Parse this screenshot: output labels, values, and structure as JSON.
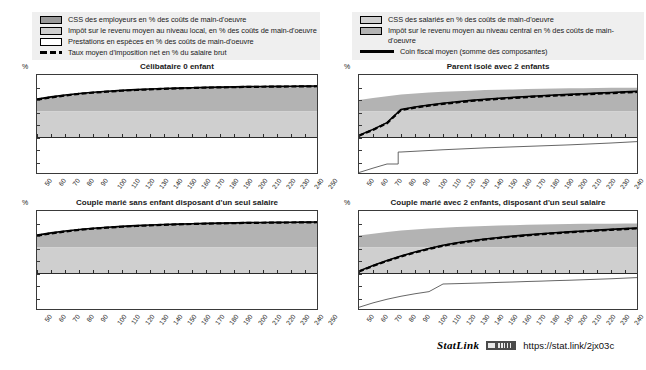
{
  "legend": {
    "left": [
      {
        "swatch": "dark",
        "label": "CSS des employeurs en % des coûts de main-d'oeuvre",
        "icon": "legend-swatch-dark-gray"
      },
      {
        "swatch": "light",
        "label": "Impôt sur le revenu moyen au niveau local, en % des coûts de main-d'oeuvre",
        "icon": "legend-swatch-light-gray"
      },
      {
        "swatch": "white",
        "label": "Prestations en espèces en % des coûts de main-d'oeuvre",
        "icon": "legend-swatch-white"
      },
      {
        "swatch": "dashed",
        "label": "Taux moyen d'imposition net en % du salaire brut",
        "icon": "legend-line-dashed"
      }
    ],
    "right": [
      {
        "swatch": "light",
        "label": "CSS des salariés en % des coûts de main-d'oeuvre",
        "icon": "legend-swatch-light-gray"
      },
      {
        "swatch": "mid",
        "label": "Impôt sur le revenu moyen au niveau central en %  des coûts de main-d'oeuvre",
        "icon": "legend-swatch-mid-gray"
      },
      {
        "swatch": "solid",
        "label": "Coin fiscal moyen (somme des composantes)",
        "icon": "legend-line-solid"
      }
    ]
  },
  "statlink": {
    "word": "StatLink",
    "badge": "statlink-barcode-icon",
    "url": "https://stat.link/2jx03c"
  },
  "axis": {
    "y_unit": "%",
    "yticks": [
      50,
      40,
      30,
      20,
      10,
      0,
      -10,
      -20,
      -30
    ],
    "xticks": [
      50,
      60,
      70,
      80,
      90,
      100,
      110,
      120,
      130,
      140,
      150,
      160,
      170,
      180,
      190,
      200,
      210,
      220,
      230,
      240,
      250
    ]
  },
  "colors": {
    "employer_ssc": "#999999",
    "central_income_tax": "#b3b3b3",
    "employee_ssc": "#cfcfcf",
    "local_income_tax": "#cfcfcf",
    "cash_benefits": "#ffffff",
    "net_tax_rate_line": "#000000",
    "tax_wedge_line": "#000000",
    "frame": "#3a3a3a",
    "legend_bg": "#efefef"
  },
  "chart_data": {
    "type": "area",
    "xlabel": "",
    "ylabel": "%",
    "xlim": [
      50,
      250
    ],
    "ylim": [
      -30,
      50
    ],
    "grid": false,
    "legend_position": "top",
    "x": [
      50,
      60,
      70,
      80,
      90,
      100,
      110,
      120,
      130,
      140,
      150,
      160,
      170,
      180,
      190,
      200,
      210,
      220,
      230,
      240,
      250
    ],
    "panels": [
      {
        "title": "Célibataire 0 enfant",
        "position": "top-left",
        "series": [
          {
            "name": "CSS des employeurs en % des coûts de main-d'oeuvre",
            "stack": "positive",
            "order": 1,
            "values": [
              20.9,
              20.9,
              20.9,
              20.9,
              20.9,
              20.9,
              20.9,
              20.9,
              20.9,
              20.9,
              20.9,
              20.9,
              20.9,
              20.9,
              20.9,
              20.9,
              20.9,
              20.9,
              20.9,
              20.9,
              20.9
            ]
          },
          {
            "name": "Impôt sur le revenu moyen au niveau central en %  des coûts de main-d'oeuvre",
            "stack": "positive",
            "order": 2,
            "values": [
              9.8,
              11.6,
              13.1,
              14.3,
              15.3,
              16.1,
              16.8,
              17.4,
              17.9,
              18.3,
              18.6,
              18.9,
              19.2,
              19.4,
              19.6,
              19.8,
              19.9,
              20.0,
              20.1,
              20.2,
              20.3
            ],
            "cumulative_top": [
              30.7,
              32.5,
              34.0,
              35.2,
              36.2,
              37.0,
              37.7,
              38.3,
              38.8,
              39.2,
              39.5,
              39.8,
              40.1,
              40.3,
              40.5,
              40.7,
              40.8,
              40.9,
              41.0,
              41.1,
              41.2
            ]
          }
        ],
        "lines": [
          {
            "name": "Coin fiscal moyen (somme des composantes)",
            "style": "solid",
            "values": [
              30.7,
              32.5,
              34.0,
              35.2,
              36.2,
              37.0,
              37.7,
              38.3,
              38.8,
              39.2,
              39.5,
              39.8,
              40.1,
              40.3,
              40.5,
              40.7,
              40.8,
              40.9,
              41.0,
              41.1,
              41.2
            ]
          },
          {
            "name": "Taux moyen d'imposition net en % du salaire brut",
            "style": "dashed",
            "values": [
              30.2,
              32.1,
              33.6,
              34.9,
              35.9,
              36.7,
              37.4,
              38.0,
              38.5,
              38.9,
              39.3,
              39.6,
              39.9,
              40.1,
              40.3,
              40.5,
              40.6,
              40.7,
              40.8,
              40.9,
              41.0
            ]
          }
        ],
        "benefits_line": null
      },
      {
        "title": "Parent isolé avec 2 enfants",
        "position": "top-right",
        "series": [
          {
            "name": "CSS des employeurs en % des coûts de main-d'oeuvre",
            "stack": "positive",
            "order": 1,
            "values": [
              20.9,
              20.9,
              20.9,
              20.9,
              20.9,
              20.9,
              20.9,
              20.9,
              20.9,
              20.9,
              20.9,
              20.9,
              20.9,
              20.9,
              20.9,
              20.9,
              20.9,
              20.9,
              20.9,
              20.9,
              20.9
            ]
          },
          {
            "name": "Impôt sur le revenu moyen au niveau central en %  des coûts de main-d'oeuvre",
            "stack": "positive",
            "order": 2,
            "values": [
              9.2,
              10.7,
              12.2,
              13.5,
              14.4,
              15.1,
              15.7,
              16.2,
              16.6,
              17.0,
              17.3,
              17.6,
              17.9,
              18.1,
              18.3,
              18.5,
              18.6,
              18.7,
              18.8,
              18.9,
              19.0
            ],
            "cumulative_top": [
              30.1,
              31.6,
              33.1,
              34.4,
              35.3,
              36.0,
              36.6,
              37.1,
              37.5,
              37.9,
              38.2,
              38.5,
              38.8,
              39.0,
              39.2,
              39.4,
              39.5,
              39.6,
              39.7,
              39.8,
              39.9
            ]
          }
        ],
        "lines": [
          {
            "name": "Coin fiscal moyen (somme des composantes)",
            "style": "solid",
            "values": [
              1.8,
              6.5,
              11.9,
              22.5,
              24.4,
              26.0,
              27.4,
              28.6,
              29.7,
              30.6,
              31.4,
              32.1,
              32.8,
              33.4,
              34.0,
              34.5,
              35.0,
              35.5,
              36.0,
              36.5,
              37.0
            ]
          },
          {
            "name": "Taux moyen d'imposition net en % du salaire brut",
            "style": "dashed",
            "values": [
              1.5,
              6.1,
              11.4,
              22.0,
              23.9,
              25.5,
              26.9,
              28.1,
              29.2,
              30.1,
              30.9,
              31.6,
              32.3,
              32.9,
              33.5,
              34.0,
              34.5,
              35.0,
              35.5,
              36.0,
              36.5
            ]
          }
        ],
        "benefits_line": {
          "name": "Prestations en espèces en % des coûts de main-d'oeuvre",
          "values": [
            -28.0,
            -24.5,
            -21.2,
            -11.6,
            -11.0,
            -10.4,
            -9.8,
            -9.3,
            -8.8,
            -8.3,
            -7.9,
            -7.5,
            -7.1,
            -6.7,
            -6.3,
            -5.9,
            -5.4,
            -4.9,
            -4.4,
            -3.8,
            -3.2
          ],
          "jump_at_x": 78
        }
      },
      {
        "title": "Couple marié sans enfant disposant d'un seul salaire",
        "position": "bottom-left",
        "series": [
          {
            "name": "CSS des employeurs en % des coûts de main-d'oeuvre",
            "stack": "positive",
            "order": 1,
            "values": [
              20.9,
              20.9,
              20.9,
              20.9,
              20.9,
              20.9,
              20.9,
              20.9,
              20.9,
              20.9,
              20.9,
              20.9,
              20.9,
              20.9,
              20.9,
              20.9,
              20.9,
              20.9,
              20.9,
              20.9,
              20.9
            ]
          },
          {
            "name": "Impôt sur le revenu moyen au niveau central en %  des coûts de main-d'oeuvre",
            "stack": "positive",
            "order": 2,
            "values": [
              9.8,
              11.6,
              13.1,
              14.3,
              15.3,
              16.1,
              16.8,
              17.4,
              17.9,
              18.3,
              18.6,
              18.9,
              19.2,
              19.4,
              19.6,
              19.8,
              19.9,
              20.0,
              20.1,
              20.2,
              20.3
            ],
            "cumulative_top": [
              30.7,
              32.5,
              34.0,
              35.2,
              36.2,
              37.0,
              37.7,
              38.3,
              38.8,
              39.2,
              39.5,
              39.8,
              40.1,
              40.3,
              40.5,
              40.7,
              40.8,
              40.9,
              41.0,
              41.1,
              41.2
            ]
          }
        ],
        "lines": [
          {
            "name": "Coin fiscal moyen (somme des composantes)",
            "style": "solid",
            "values": [
              30.7,
              32.5,
              34.0,
              35.2,
              36.2,
              37.0,
              37.7,
              38.3,
              38.8,
              39.2,
              39.5,
              39.8,
              40.1,
              40.3,
              40.5,
              40.7,
              40.8,
              40.9,
              41.0,
              41.1,
              41.2
            ]
          },
          {
            "name": "Taux moyen d'imposition net en % du salaire brut",
            "style": "dashed",
            "values": [
              30.2,
              32.1,
              33.6,
              34.9,
              35.9,
              36.7,
              37.4,
              38.0,
              38.5,
              38.9,
              39.3,
              39.6,
              39.9,
              40.1,
              40.3,
              40.5,
              40.6,
              40.7,
              40.8,
              40.9,
              41.0
            ]
          }
        ],
        "benefits_line": null
      },
      {
        "title": "Couple marié avec 2 enfants, disposant d'un seul salaire",
        "position": "bottom-right",
        "series": [
          {
            "name": "CSS des employeurs en % des coûts de main-d'oeuvre",
            "stack": "positive",
            "order": 1,
            "values": [
              20.9,
              20.9,
              20.9,
              20.9,
              20.9,
              20.9,
              20.9,
              20.9,
              20.9,
              20.9,
              20.9,
              20.9,
              20.9,
              20.9,
              20.9,
              20.9,
              20.9,
              20.9,
              20.9,
              20.9,
              20.9
            ]
          },
          {
            "name": "Impôt sur le revenu moyen au niveau central en %  des coûts de main-d'oeuvre",
            "stack": "positive",
            "order": 2,
            "values": [
              9.6,
              11.0,
              12.4,
              13.5,
              14.4,
              15.2,
              15.8,
              16.3,
              16.8,
              17.2,
              17.5,
              17.8,
              18.1,
              18.3,
              18.5,
              18.7,
              18.8,
              18.9,
              19.0,
              19.1,
              19.2
            ],
            "cumulative_top": [
              30.5,
              31.9,
              33.3,
              34.4,
              35.3,
              36.1,
              36.7,
              37.2,
              37.7,
              38.1,
              38.4,
              38.7,
              39.0,
              39.2,
              39.4,
              39.6,
              39.7,
              39.8,
              39.9,
              40.0,
              40.1
            ]
          }
        ],
        "lines": [
          {
            "name": "Coin fiscal moyen (somme des composantes)",
            "style": "solid",
            "values": [
              1.9,
              6.4,
              10.4,
              14.0,
              17.2,
              20.0,
              22.6,
              24.6,
              26.2,
              27.6,
              28.8,
              29.9,
              30.9,
              31.8,
              32.6,
              33.3,
              34.0,
              34.7,
              35.3,
              35.9,
              36.5
            ]
          },
          {
            "name": "Taux moyen d'imposition net en % du salaire brut",
            "style": "dashed",
            "values": [
              1.6,
              6.0,
              10.0,
              13.6,
              16.8,
              19.6,
              22.2,
              24.2,
              25.8,
              27.2,
              28.4,
              29.5,
              30.5,
              31.4,
              32.2,
              32.9,
              33.6,
              34.3,
              34.9,
              35.5,
              36.1
            ]
          }
        ],
        "benefits_line": {
          "name": "Prestations en espèces en % des coûts de main-d'oeuvre",
          "values": [
            -27.0,
            -23.5,
            -20.6,
            -18.2,
            -16.2,
            -14.5,
            -8.4,
            -8.1,
            -7.8,
            -7.5,
            -7.1,
            -6.8,
            -6.4,
            -6.1,
            -5.7,
            -5.4,
            -5.0,
            -4.6,
            -4.2,
            -3.7,
            -3.2
          ],
          "jump_at_x": 110
        }
      }
    ]
  }
}
